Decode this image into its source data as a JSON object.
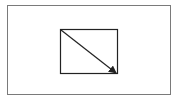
{
  "diagram": {
    "frame": {
      "border_color": "#7a7a7a"
    },
    "shape": {
      "type": "rectangle",
      "stroke": "#222222",
      "x": 60,
      "y": 29,
      "width": 57,
      "height": 45
    },
    "arrow": {
      "from": "top-left",
      "to": "bottom-right",
      "stroke": "#222222"
    }
  }
}
